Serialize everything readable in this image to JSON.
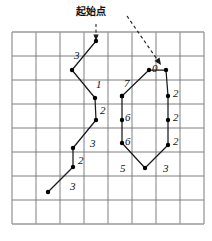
{
  "figure": {
    "title_annotation": "起始点",
    "grid": {
      "cols": 8,
      "rows": 8,
      "left": 12,
      "top": 32,
      "cell": 24,
      "line_color": "#6f6f6f",
      "border_color": "#9a9a9a"
    },
    "colors": {
      "stroke": "#1a1a1a",
      "vertex": "#000000",
      "dashed": "#2a2a2a",
      "text": "#111111"
    },
    "pointer": {
      "name": "dashed-arrow",
      "from": [
        127,
        16
      ],
      "to": [
        161,
        65
      ]
    },
    "start_marker": {
      "name": "start-point",
      "at": [
        96,
        41
      ],
      "tick_from": [
        96,
        24
      ],
      "tick_to": [
        96,
        36
      ]
    },
    "chain_left": {
      "name": "left-polyline",
      "points": [
        [
          96,
          41
        ],
        [
          72,
          70
        ],
        [
          95,
          98
        ],
        [
          96,
          120
        ],
        [
          73,
          148
        ],
        [
          73,
          167
        ],
        [
          48,
          192
        ]
      ],
      "edge_labels": [
        {
          "text": "3",
          "x": 74,
          "y": 50
        },
        {
          "text": "1",
          "x": 96,
          "y": 79
        },
        {
          "text": "2",
          "x": 100,
          "y": 105
        },
        {
          "text": "3",
          "x": 90,
          "y": 138
        },
        {
          "text": "2",
          "x": 78,
          "y": 155
        },
        {
          "text": "3",
          "x": 70,
          "y": 181
        }
      ]
    },
    "chain_right": {
      "name": "right-polyline",
      "points": [
        [
          122,
          96
        ],
        [
          149,
          70
        ],
        [
          166,
          70
        ],
        [
          168,
          96
        ],
        [
          168,
          120
        ],
        [
          168,
          145
        ],
        [
          145,
          168
        ],
        [
          122,
          143
        ],
        [
          122,
          120
        ],
        [
          122,
          96
        ]
      ],
      "edge_labels": [
        {
          "text": "7",
          "x": 124,
          "y": 78
        },
        {
          "text": "0",
          "x": 152,
          "y": 63
        },
        {
          "text": "2",
          "x": 173,
          "y": 88
        },
        {
          "text": "2",
          "x": 173,
          "y": 112
        },
        {
          "text": "2",
          "x": 173,
          "y": 136
        },
        {
          "text": "3",
          "x": 163,
          "y": 163
        },
        {
          "text": "5",
          "x": 120,
          "y": 163
        },
        {
          "text": "6",
          "x": 125,
          "y": 136
        },
        {
          "text": "6",
          "x": 125,
          "y": 112
        }
      ]
    },
    "cjk_annotation": {
      "text": "起始点",
      "x": 76,
      "y": 7
    }
  },
  "chart_data": {
    "type": "line",
    "title": "起始点",
    "xlabel": "",
    "ylabel": "",
    "grid": true,
    "legend": "none",
    "xlim": [
      0,
      8
    ],
    "ylim": [
      0,
      8
    ],
    "annotations": [
      "起始点"
    ],
    "series": [
      {
        "name": "left-chain",
        "x": [
          3.5,
          2.5,
          3.45,
          3.5,
          2.55,
          2.55,
          1.5
        ],
        "y": [
          7.62,
          6.42,
          5.25,
          4.33,
          3.17,
          2.38,
          1.33
        ],
        "edge_values": [
          3,
          1,
          2,
          3,
          2,
          3
        ]
      },
      {
        "name": "right-chain",
        "x": [
          4.58,
          5.7,
          6.42,
          6.5,
          6.5,
          6.5,
          5.54,
          4.58,
          4.58,
          4.58
        ],
        "y": [
          5.33,
          6.42,
          6.42,
          5.33,
          4.33,
          3.29,
          2.33,
          3.38,
          4.33,
          5.33
        ],
        "edge_values": [
          7,
          0,
          2,
          2,
          2,
          3,
          5,
          6,
          6
        ]
      }
    ]
  }
}
